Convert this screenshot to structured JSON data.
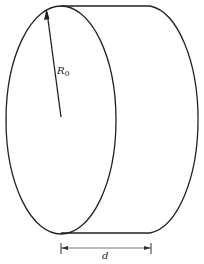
{
  "diagram": {
    "type": "cylinder-disk",
    "labels": {
      "radius_symbol": "R",
      "radius_subscript": "0",
      "thickness": "d"
    },
    "colors": {
      "stroke": "#222222",
      "background": "#ffffff"
    }
  }
}
